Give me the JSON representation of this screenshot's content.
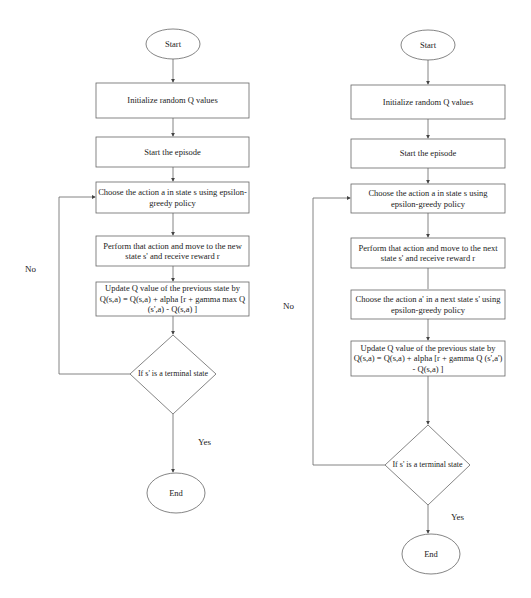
{
  "left_flowchart": {
    "start": "Start",
    "steps": [
      "Initialize random Q values",
      "Start the episode",
      "Choose the action a in state s using epsilon-greedy policy",
      "Perform that action and move to the new state s' and receive reward r",
      "Update Q value of the previous state by Q(s,a) = Q(s,a) + alpha [r + gamma max Q (s',a) - Q(s,a) ]"
    ],
    "decision": "If s' is a terminal state",
    "no_label": "No",
    "yes_label": "Yes",
    "end": "End"
  },
  "right_flowchart": {
    "start": "Start",
    "steps": [
      "Initialize random Q values",
      "Start the episode",
      "Choose the action a in state s using epsilon-greedy policy",
      "Perform that action and move to the next state s' and receive reward r",
      "Choose the action a' in a next state s' using epsilon-greedy policy",
      "Update Q value of the previous state by Q(s,a) = Q(s,a) + alpha [r + gamma Q (s',a') - Q(s,a) ]"
    ],
    "decision": "If s' is a terminal state",
    "no_label": "No",
    "yes_label": "Yes",
    "end": "End"
  },
  "colors": {
    "line": "#555555",
    "text": "#222222",
    "background": "#ffffff"
  }
}
